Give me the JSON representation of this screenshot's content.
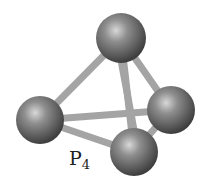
{
  "molecule": {
    "formula_main": "P",
    "formula_sub": "4",
    "atoms": [
      {
        "name": "top",
        "cx": 121,
        "cy": 38,
        "r": 25
      },
      {
        "name": "left",
        "cx": 40,
        "cy": 120,
        "r": 24
      },
      {
        "name": "right",
        "cx": 171,
        "cy": 110,
        "r": 24
      },
      {
        "name": "bottom",
        "cx": 134,
        "cy": 152,
        "r": 24
      }
    ],
    "colors": {
      "atom": "#6e6e6e",
      "bond": "#a8a8a8",
      "background": "#ffffff"
    }
  }
}
